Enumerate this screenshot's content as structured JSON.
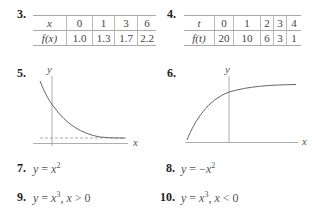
{
  "problems": {
    "p3": {
      "number": "3.",
      "headers": [
        "x",
        "0",
        "1",
        "3",
        "6"
      ],
      "values": [
        "f(x)",
        "1.0",
        "1.3",
        "1.7",
        "2.2"
      ]
    },
    "p4": {
      "number": "4.",
      "headers": [
        "t",
        "0",
        "1",
        "2",
        "3",
        "4"
      ],
      "values": [
        "f(t)",
        "20",
        "10",
        "6",
        "3",
        "1"
      ]
    },
    "p5": {
      "number": "5.",
      "y_label": "y",
      "x_label": "x",
      "description": "decreasing exponential decay curve approaching dashed horizontal asymptote above x-axis"
    },
    "p6": {
      "number": "6.",
      "y_label": "y",
      "x_label": "x",
      "description": "increasing concave-down curve leveling off"
    },
    "p7": {
      "number": "7.",
      "lhs": "y",
      "eq": " = ",
      "rhs": "x",
      "exp": "2"
    },
    "p8": {
      "number": "8.",
      "lhs": "y",
      "eq": " = −",
      "rhs": "x",
      "exp": "2"
    },
    "p9": {
      "number": "9.",
      "lhs": "y",
      "eq": " = ",
      "rhs": "x",
      "exp": "3",
      "cond_var": "x",
      "cond": " > 0"
    },
    "p10": {
      "number": "10.",
      "lhs": "y",
      "eq": " = ",
      "rhs": "x",
      "exp": "3",
      "cond_var": "x",
      "cond": " < 0"
    }
  }
}
